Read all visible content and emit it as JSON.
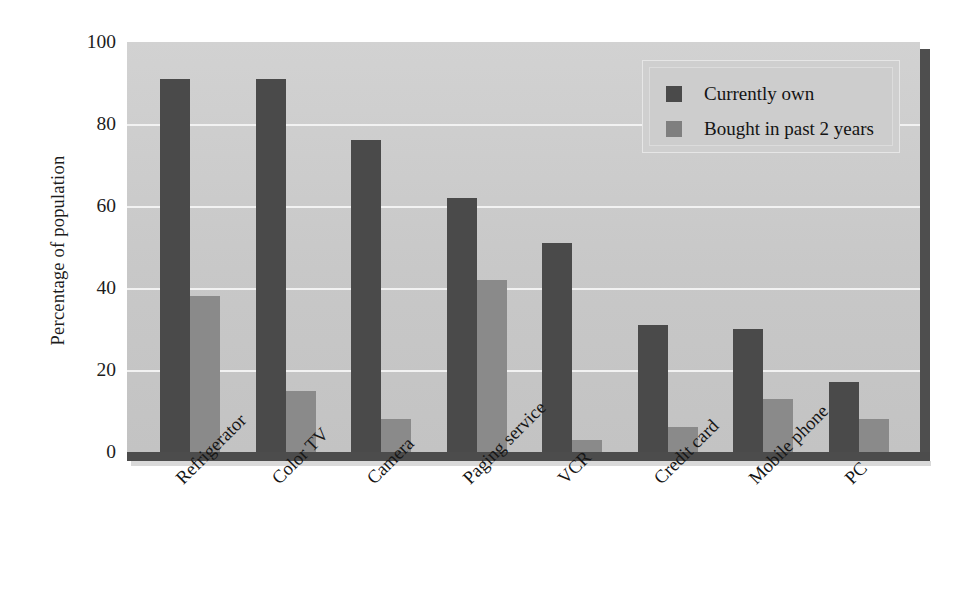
{
  "chart_data": {
    "type": "bar",
    "title": "",
    "xlabel": "",
    "ylabel": "Percentage of population",
    "ylim": [
      0,
      100
    ],
    "ytick_values": [
      100,
      80,
      60,
      40,
      20,
      0
    ],
    "ytick_labels": [
      "100",
      "80",
      "60",
      "40",
      "20",
      "0"
    ],
    "grid": true,
    "legend_position": "top-right",
    "categories": [
      "Refrigerator",
      "Color TV",
      "Camera",
      "Paging service",
      "VCR",
      "Credit card",
      "Mobile phone",
      "PC"
    ],
    "series": [
      {
        "name": "Currently own",
        "color": "#4a4a4a",
        "values": [
          91,
          91,
          76,
          62,
          51,
          31,
          30,
          17
        ]
      },
      {
        "name": "Bought in past 2 years",
        "color": "#8a8a8a",
        "values": [
          38,
          15,
          8,
          42,
          3,
          6,
          13,
          8
        ]
      }
    ]
  },
  "legend": {
    "items": [
      {
        "label": "Currently own",
        "swatch": "own"
      },
      {
        "label": "Bought in past 2 years",
        "swatch": "bought"
      }
    ]
  },
  "colors": {
    "series_own": "#4a4a4a",
    "series_bought": "#8a8a8a",
    "plot_background": "#cbcbcb",
    "gridline": "#f2f2f2",
    "axis_floor": "#4c4c4c",
    "text": "#161616"
  }
}
